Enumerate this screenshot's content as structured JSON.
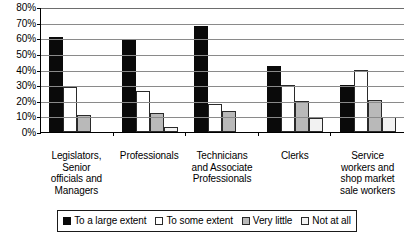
{
  "chart_data": {
    "type": "bar",
    "title": "",
    "subtitle": "",
    "xlabel": "",
    "ylabel": "",
    "ylim": [
      0,
      80
    ],
    "ytick_labels": [
      "80%",
      "70%",
      "60%",
      "50%",
      "40%",
      "30%",
      "20%",
      "10%",
      "0%"
    ],
    "ytick_values": [
      80,
      70,
      60,
      50,
      40,
      30,
      20,
      10,
      0
    ],
    "grid": true,
    "legend_position": "bottom",
    "categories": [
      "Legislators, Senior officials and Managers",
      "Professionals",
      "Technicians and Associate Professionals",
      "Clerks",
      "Service workers and shop market sale workers"
    ],
    "category_label_lines": [
      [
        "Legislators,",
        "Senior",
        "officials and",
        "Managers"
      ],
      [
        "Professionals"
      ],
      [
        "Technicians",
        "and Associate",
        "Professionals"
      ],
      [
        "Clerks"
      ],
      [
        "Service",
        "workers and",
        "shop market",
        "sale workers"
      ]
    ],
    "series": [
      {
        "name": "To a large extent",
        "color": "#0a0a0a",
        "values": [
          61,
          59,
          68,
          42,
          30
        ]
      },
      {
        "name": "To some extent",
        "color": "#ffffff",
        "values": [
          29,
          26,
          18,
          30,
          39.5
        ]
      },
      {
        "name": "Very little",
        "color": "#b9b9b9",
        "values": [
          11,
          12,
          13.5,
          20,
          20.5
        ]
      },
      {
        "name": "Not at all",
        "color": "#f2f2f2",
        "values": [
          0,
          3,
          0,
          9,
          9.5
        ]
      }
    ]
  }
}
